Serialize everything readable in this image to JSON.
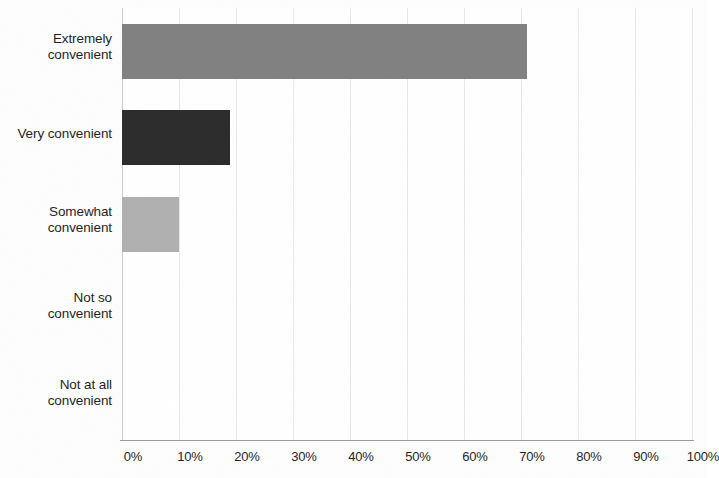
{
  "chart_data": {
    "type": "bar",
    "orientation": "horizontal",
    "title": "",
    "subtitle": "",
    "xlabel": "",
    "ylabel": "",
    "categories": [
      "Extremely convenient",
      "Very convenient",
      "Somewhat convenient",
      "Not so convenient",
      "Not at all convenient"
    ],
    "values": [
      71,
      19,
      10,
      0,
      0
    ],
    "value_suffix": "%",
    "xlim": [
      0,
      100
    ],
    "xticks": [
      0,
      10,
      20,
      30,
      40,
      50,
      60,
      70,
      80,
      90,
      100
    ],
    "xticklabels": [
      "0%",
      "10%",
      "20%",
      "30%",
      "40%",
      "50%",
      "60%",
      "70%",
      "80%",
      "90%",
      "100%"
    ],
    "grid": true,
    "grid_axis": "x",
    "legend": false,
    "data_labels": false,
    "bar_colors": [
      "#808080",
      "#2b2b2b",
      "#b0b0b0",
      "#808080",
      "#808080"
    ],
    "background_color": "#ffffff",
    "gridline_color": "#e8e8e8",
    "axis_color": "#9a9a9a",
    "label_color": "#1f1f1f"
  },
  "category_label_lines": [
    [
      "Extremely",
      "convenient"
    ],
    [
      "Very convenient"
    ],
    [
      "Somewhat",
      "convenient"
    ],
    [
      "Not so",
      "convenient"
    ],
    [
      "Not at all",
      "convenient"
    ]
  ]
}
